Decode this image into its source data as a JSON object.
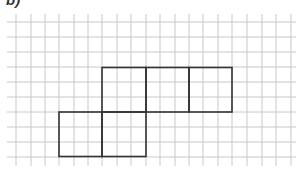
{
  "label": "b)",
  "grid": {
    "x_lines": [
      16,
      31,
      45,
      59,
      74,
      88,
      102,
      117,
      131,
      146,
      160,
      175,
      189,
      203,
      218,
      232,
      247,
      262,
      276,
      291
    ],
    "y_lines": [
      22,
      37,
      52,
      67,
      82,
      97,
      112,
      127,
      142,
      157
    ],
    "x_start": 7,
    "x_end": 296,
    "y_start": 14,
    "y_end": 166,
    "line_color": "#c8c8c8"
  },
  "shape": {
    "stroke_color": "#333333",
    "squares": [
      {
        "x": 102,
        "y": 67.5,
        "size": 44
      },
      {
        "x": 146,
        "y": 67.5,
        "size": 43
      },
      {
        "x": 189,
        "y": 67.5,
        "size": 43
      },
      {
        "x": 59,
        "y": 112,
        "size": 43
      },
      {
        "x": 102,
        "y": 112,
        "size": 44
      }
    ]
  }
}
